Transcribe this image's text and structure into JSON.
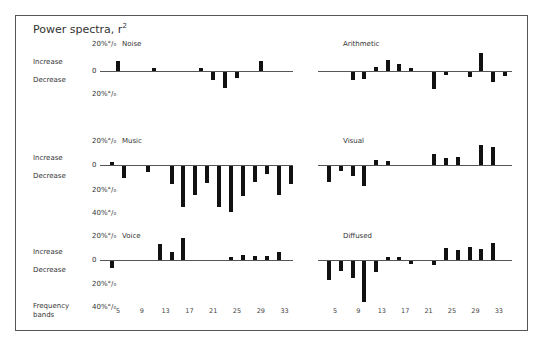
{
  "title": "Power spectra, r",
  "title_sup": "2",
  "row_labels": {
    "increase": "Increase",
    "decrease": "Decrease",
    "frequency": "Frequency",
    "bands": "bands"
  },
  "axis_labels": {
    "zero": "0",
    "p20": "20%",
    "p40": "40%"
  },
  "chart_data": {
    "type": "bar",
    "xlabel": "Frequency bands",
    "ylabel": "Increase / Decrease (%)",
    "x_ticks": [
      5,
      9,
      13,
      17,
      21,
      25,
      29,
      33
    ],
    "ylim": [
      -40,
      20
    ],
    "grid": false,
    "panels": [
      {
        "name": "Noise",
        "col": 0,
        "row": 0,
        "bars": [
          {
            "band": 5,
            "value": 8
          },
          {
            "band": 11,
            "value": 2
          },
          {
            "band": 19,
            "value": 2
          },
          {
            "band": 21,
            "value": -7
          },
          {
            "band": 23,
            "value": -13
          },
          {
            "band": 25,
            "value": -5
          },
          {
            "band": 29,
            "value": 8
          }
        ]
      },
      {
        "name": "Arithmetic",
        "col": 1,
        "row": 0,
        "bars": [
          {
            "band": 8,
            "value": -7
          },
          {
            "band": 10,
            "value": -6
          },
          {
            "band": 12,
            "value": 3
          },
          {
            "band": 14,
            "value": 9
          },
          {
            "band": 16,
            "value": 6
          },
          {
            "band": 18,
            "value": 2
          },
          {
            "band": 22,
            "value": -14
          },
          {
            "band": 24,
            "value": -2
          },
          {
            "band": 28,
            "value": -4
          },
          {
            "band": 30,
            "value": 15
          },
          {
            "band": 32,
            "value": -8
          },
          {
            "band": 34,
            "value": -3
          }
        ]
      },
      {
        "name": "Music",
        "col": 0,
        "row": 1,
        "bars": [
          {
            "band": 4,
            "value": 1
          },
          {
            "band": 6,
            "value": -10
          },
          {
            "band": 10,
            "value": -5
          },
          {
            "band": 14,
            "value": -15
          },
          {
            "band": 16,
            "value": -34
          },
          {
            "band": 18,
            "value": -24
          },
          {
            "band": 20,
            "value": -14
          },
          {
            "band": 22,
            "value": -34
          },
          {
            "band": 24,
            "value": -38
          },
          {
            "band": 26,
            "value": -25
          },
          {
            "band": 28,
            "value": -13
          },
          {
            "band": 30,
            "value": -7
          },
          {
            "band": 32,
            "value": -24
          },
          {
            "band": 34,
            "value": -15
          }
        ]
      },
      {
        "name": "Visual",
        "col": 1,
        "row": 1,
        "bars": [
          {
            "band": 4,
            "value": -13
          },
          {
            "band": 6,
            "value": -4
          },
          {
            "band": 8,
            "value": -8
          },
          {
            "band": 10,
            "value": -17
          },
          {
            "band": 12,
            "value": 4
          },
          {
            "band": 14,
            "value": 3
          },
          {
            "band": 22,
            "value": 9
          },
          {
            "band": 24,
            "value": 6
          },
          {
            "band": 26,
            "value": 7
          },
          {
            "band": 30,
            "value": 17
          },
          {
            "band": 32,
            "value": 15
          }
        ]
      },
      {
        "name": "Voice",
        "col": 0,
        "row": 2,
        "bars": [
          {
            "band": 4,
            "value": -6
          },
          {
            "band": 12,
            "value": 13
          },
          {
            "band": 14,
            "value": 7
          },
          {
            "band": 16,
            "value": 18
          },
          {
            "band": 24,
            "value": 2
          },
          {
            "band": 26,
            "value": 4
          },
          {
            "band": 28,
            "value": 3
          },
          {
            "band": 30,
            "value": 3
          },
          {
            "band": 32,
            "value": 7
          }
        ]
      },
      {
        "name": "Diffused",
        "col": 1,
        "row": 2,
        "bars": [
          {
            "band": 4,
            "value": -16
          },
          {
            "band": 6,
            "value": -8
          },
          {
            "band": 8,
            "value": -14
          },
          {
            "band": 10,
            "value": -34
          },
          {
            "band": 12,
            "value": -9
          },
          {
            "band": 14,
            "value": 2
          },
          {
            "band": 16,
            "value": 1
          },
          {
            "band": 18,
            "value": -2
          },
          {
            "band": 22,
            "value": -3
          },
          {
            "band": 24,
            "value": 10
          },
          {
            "band": 26,
            "value": 8
          },
          {
            "band": 28,
            "value": 11
          },
          {
            "band": 30,
            "value": 9
          },
          {
            "band": 32,
            "value": 14
          }
        ]
      }
    ]
  }
}
